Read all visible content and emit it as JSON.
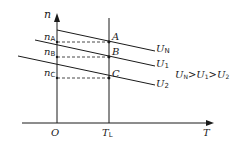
{
  "diagram": {
    "axes": {
      "y_label": "n",
      "x_label": "T",
      "origin_label": "O",
      "load_torque_label": "T",
      "load_torque_sub": "L"
    },
    "speed_levels": [
      {
        "label": "n",
        "sub": "A"
      },
      {
        "label": "n",
        "sub": "B"
      },
      {
        "label": "n",
        "sub": "C"
      }
    ],
    "points": [
      "A",
      "B",
      "C"
    ],
    "curves": [
      {
        "label": "U",
        "sub": "N"
      },
      {
        "label": "U",
        "sub": "1"
      },
      {
        "label": "U",
        "sub": "2"
      }
    ],
    "relation": {
      "text_parts": [
        "U",
        "N",
        ">",
        "U",
        "1",
        ">",
        "U",
        "2"
      ]
    },
    "colors": {
      "line": "#1a1a1a",
      "background": "#ffffff"
    }
  }
}
